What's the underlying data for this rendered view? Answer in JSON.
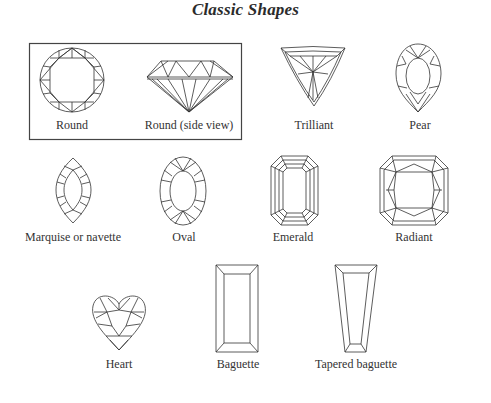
{
  "title": "Classic Shapes",
  "shapes": [
    {
      "id": "round",
      "label": "Round",
      "grouped": true
    },
    {
      "id": "round-side",
      "label": "Round (side view)",
      "grouped": true
    },
    {
      "id": "trilliant",
      "label": "Trilliant"
    },
    {
      "id": "pear",
      "label": "Pear"
    },
    {
      "id": "marquise",
      "label": "Marquise or navette"
    },
    {
      "id": "oval",
      "label": "Oval"
    },
    {
      "id": "emerald",
      "label": "Emerald"
    },
    {
      "id": "radiant",
      "label": "Radiant"
    },
    {
      "id": "heart",
      "label": "Heart"
    },
    {
      "id": "baguette",
      "label": "Baguette"
    },
    {
      "id": "tapered-baguette",
      "label": "Tapered baguette"
    }
  ],
  "colors": {
    "line": "#333333",
    "background": "#ffffff"
  }
}
